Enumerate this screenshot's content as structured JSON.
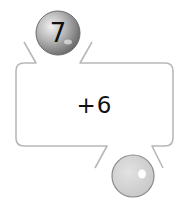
{
  "machine": {
    "operation": "+6",
    "input_value": "7",
    "output_value": ""
  },
  "colors": {
    "outline": "#b8b8b8",
    "input_ball": "#8a8a8a",
    "output_ball": "#d4d4d4",
    "text": "#111111"
  }
}
